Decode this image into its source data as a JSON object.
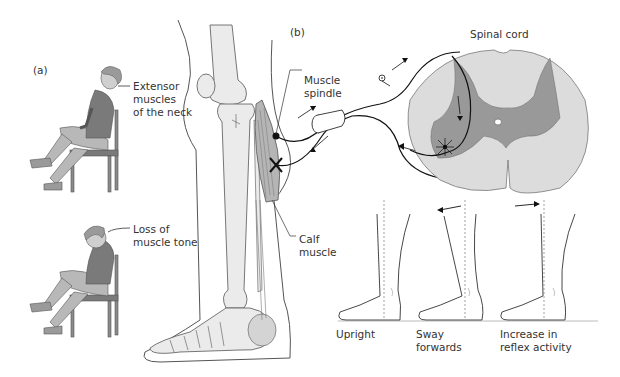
{
  "panel_a": {
    "label": "(a)",
    "upper_figure": {
      "caption": "Extensor\nmuscles\nof the neck"
    },
    "lower_figure": {
      "caption": "Loss of\nmuscle tone"
    }
  },
  "panel_b": {
    "label": "(b)",
    "leg": {
      "spindle_label": "Muscle\nspindle",
      "calf_label": "Calf\nmuscle"
    },
    "spinal_cord": {
      "title": "Spinal cord"
    },
    "stance_sequence": [
      {
        "caption": "Upright"
      },
      {
        "caption": "Sway\nforwards"
      },
      {
        "caption": "Increase in\nreflex activity"
      }
    ]
  },
  "colors": {
    "line": "#333333",
    "bone": "#ebebeb",
    "muscle": "#b5b5b5",
    "grey_matter": "#999999",
    "white_matter": "#dcdcdc",
    "figure_skin": "#cfcfcf",
    "figure_shirt": "#7a7a7a",
    "figure_pants": "#b8b8b8"
  }
}
